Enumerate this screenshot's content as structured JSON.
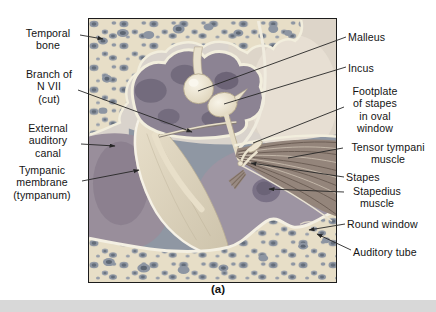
{
  "figure": {
    "caption": "(a)",
    "labels": {
      "temporal_bone": "Temporal\nbone",
      "branch_of_n_vii": "Branch of\nN VII\n(cut)",
      "external_auditory_canal": "External\nauditory\ncanal",
      "tympanic_membrane": "Tympanic\nmembrane\n(tympanum)",
      "malleus": "Malleus",
      "incus": "Incus",
      "footplate_of_stapes": "Footplate\nof stapes\nin oval\nwindow",
      "tensor_tympani_muscle": "Tensor tympani\nmuscle",
      "stapes": "Stapes",
      "stapedius_muscle": "Stapedius\nmuscle",
      "round_window": "Round window",
      "auditory_tube": "Auditory tube"
    }
  },
  "colors": {
    "background": "#ffffff",
    "frame_border": "#1c1c1c",
    "label_text": "#141414",
    "leader_line": "#262626",
    "bone_cream": "#e7dec7",
    "bone_hole_gray": "#8e96a3",
    "attic_cavity_mauve": "#8c8393",
    "cavity_shadow": "#6e6779",
    "tympanic_cavity_gray": "#8f97a3",
    "promontory_mauve": "#9d94a2",
    "canal_mauve": "#998e9b",
    "ossicle_cream": "#ece4d0",
    "muscle_brown": "#94857b",
    "membrane_cream": "#ddd3bd",
    "rim_white": "#f2eedd",
    "smooth_bone": "#ddd5c9",
    "scan_band_gray": "#d8d8d8"
  }
}
